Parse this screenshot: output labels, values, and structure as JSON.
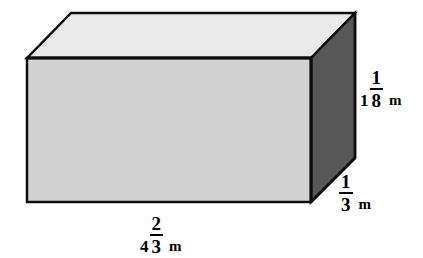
{
  "figure": {
    "name": "rectangular-prism",
    "shape_type": "rectangular prism",
    "background_color": "#ffffff",
    "faces": {
      "front": {
        "label": "front-face",
        "fill": "#d2d2d2"
      },
      "top": {
        "label": "top-face",
        "fill": "#e9e9e9"
      },
      "right": {
        "label": "right-face",
        "fill": "#575757"
      }
    },
    "edge_color": "#0d0d0d",
    "edge_width": 2.5
  },
  "dimensions": {
    "height": {
      "whole": "1",
      "numerator": "1",
      "denominator": "8",
      "unit": "m",
      "full_text": "1 1/8 m",
      "edge": "vertical-right-front"
    },
    "depth": {
      "whole": "",
      "numerator": "1",
      "denominator": "3",
      "unit": "m",
      "full_text": "1/3 m",
      "edge": "diagonal-bottom-right"
    },
    "width": {
      "whole": "4",
      "numerator": "2",
      "denominator": "3",
      "unit": "m",
      "full_text": "4 2/3 m",
      "edge": "horizontal-bottom-front"
    }
  },
  "geometry": {
    "front_top_left": [
      27,
      58
    ],
    "front_top_right": [
      311,
      58
    ],
    "front_bottom_left": [
      27,
      202
    ],
    "front_bottom_right": [
      311,
      202
    ],
    "back_top_left": [
      71,
      13
    ],
    "back_top_right": [
      355,
      13
    ],
    "back_bottom_right": [
      355,
      158
    ]
  }
}
